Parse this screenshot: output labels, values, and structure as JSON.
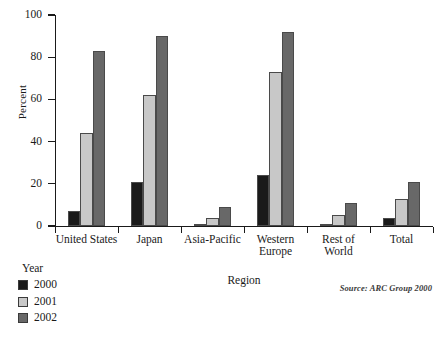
{
  "chart_data": {
    "type": "bar",
    "title": "",
    "xlabel": "Region",
    "ylabel": "Percent",
    "ylim": [
      0,
      100
    ],
    "yticks": [
      0,
      20,
      40,
      60,
      80,
      100
    ],
    "grid": false,
    "legend_title": "Year",
    "legend_position": "bottom-left",
    "categories": [
      "United States",
      "Japan",
      "Asia-Pacific",
      "Western\nEurope",
      "Rest of\nWorld",
      "Total"
    ],
    "series": [
      {
        "name": "2000",
        "color": "#1a1a1a",
        "values": [
          7,
          21,
          1,
          24,
          0.5,
          4
        ]
      },
      {
        "name": "2001",
        "color": "#c8c8c8",
        "values": [
          44,
          62,
          4,
          73,
          5,
          13
        ]
      },
      {
        "name": "2002",
        "color": "#686868",
        "values": [
          83,
          90,
          9,
          92,
          11,
          21
        ]
      }
    ],
    "annotations": [
      {
        "name": "source-note",
        "text": "Source: ARC Group 2000"
      }
    ]
  },
  "source": {
    "text": "Source: ARC Group 2000"
  }
}
